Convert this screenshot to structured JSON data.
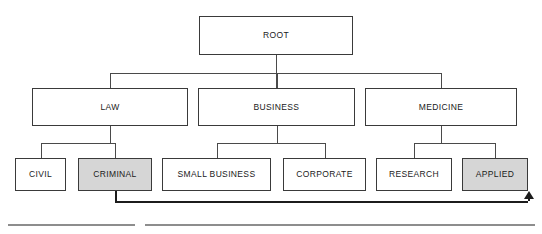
{
  "diagram": {
    "title": "ROOT",
    "root": {
      "label": "ROOT",
      "shaded": false,
      "x": 199,
      "y": 16,
      "w": 154,
      "h": 39
    },
    "level2": [
      {
        "label": "LAW",
        "shaded": false,
        "x": 32,
        "y": 88,
        "w": 156,
        "h": 38
      },
      {
        "label": "BUSINESS",
        "shaded": false,
        "x": 198,
        "y": 88,
        "w": 157,
        "h": 38
      },
      {
        "label": "MEDICINE",
        "shaded": false,
        "x": 365,
        "y": 88,
        "w": 152,
        "h": 38
      }
    ],
    "leaves": [
      {
        "label": "CIVIL",
        "shaded": false,
        "parent": "LAW",
        "x": 15,
        "y": 158,
        "w": 51,
        "h": 33
      },
      {
        "label": "CRIMINAL",
        "shaded": true,
        "parent": "LAW",
        "x": 78,
        "y": 158,
        "w": 74,
        "h": 33
      },
      {
        "label": "SMALL BUSINESS",
        "shaded": false,
        "parent": "BUSINESS",
        "x": 162,
        "y": 158,
        "w": 109,
        "h": 33
      },
      {
        "label": "CORPORATE",
        "shaded": false,
        "parent": "BUSINESS",
        "x": 283,
        "y": 158,
        "w": 83,
        "h": 33
      },
      {
        "label": "RESEARCH",
        "shaded": false,
        "parent": "MEDICINE",
        "x": 376,
        "y": 158,
        "w": 76,
        "h": 33
      },
      {
        "label": "APPLIED",
        "shaded": true,
        "parent": "MEDICINE",
        "x": 462,
        "y": 158,
        "w": 66,
        "h": 33
      }
    ],
    "cross_link": {
      "from": "CRIMINAL",
      "to": "APPLIED",
      "direction": "up",
      "has_arrowhead": true
    },
    "colors": {
      "box_border": "#3a3a3a",
      "box_fill": "#ffffff",
      "shaded_fill": "#d6d6d6",
      "edge": "#4a4a4a",
      "link": "#1c1c1c",
      "text": "#1a1a1a",
      "rule": "#8d8d8d",
      "background": "#ffffff"
    },
    "footer_rules": [
      {
        "x": 8,
        "y": 224,
        "w": 127
      },
      {
        "x": 145,
        "y": 224,
        "w": 390
      }
    ]
  }
}
